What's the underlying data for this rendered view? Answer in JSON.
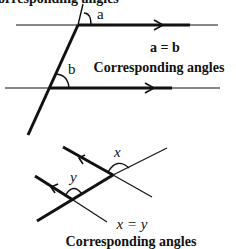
{
  "top_figure": {
    "angle_a_label": "a",
    "angle_b_label": "b",
    "equation": "a = b",
    "caption": "Corresponding angles",
    "cutoff_caption": "Corresponding angles"
  },
  "bottom_figure": {
    "angle_x_label": "x",
    "angle_y_label": "y",
    "equation": "x = y",
    "caption": "Corresponding angles"
  },
  "colors": {
    "ink": "#111111",
    "background": "#ffffff"
  }
}
